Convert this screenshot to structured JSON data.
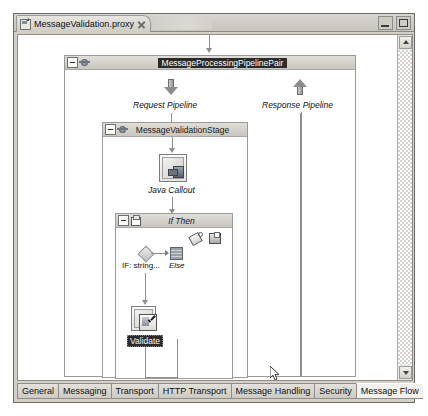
{
  "window": {
    "tab_label": "MessageValidation.proxy",
    "tab_file_icon": "proxy-file-icon",
    "tab_close_icon": "close-icon",
    "minimize_label": "Minimize",
    "maximize_label": "Maximize"
  },
  "diagram": {
    "pipeline_pair": {
      "title": "MessageProcessingPipelinePair",
      "selected": true
    },
    "request_pipeline": {
      "label": "Request Pipeline",
      "arrow": "arrow-down-icon"
    },
    "response_pipeline": {
      "label": "Response Pipeline",
      "arrow": "arrow-up-icon"
    },
    "stage": {
      "title": "MessageValidationStage"
    },
    "java_callout": {
      "label": "Java Callout",
      "icon": "java-callout-icon"
    },
    "if_then": {
      "title": "If Then",
      "condition_label": "IF: string...",
      "else_label": "Else",
      "tools": [
        {
          "name": "tag-icon",
          "label": "Add Condition"
        },
        {
          "name": "note-icon",
          "label": "Add Else"
        }
      ]
    },
    "validate": {
      "label": "Validate",
      "selected": true,
      "icon": "validate-icon"
    }
  },
  "scrollbar": {
    "up_arrow": "scroll-up-icon",
    "down_arrow": "scroll-down-icon"
  },
  "bottom_tabs": {
    "items": [
      {
        "label": "General",
        "active": false
      },
      {
        "label": "Messaging",
        "active": false
      },
      {
        "label": "Transport",
        "active": false
      },
      {
        "label": "HTTP Transport",
        "active": false
      },
      {
        "label": "Message Handling",
        "active": false
      },
      {
        "label": "Security",
        "active": false
      },
      {
        "label": "Message Flow",
        "active": true
      }
    ]
  },
  "cursor": {
    "name": "mouse-pointer"
  }
}
